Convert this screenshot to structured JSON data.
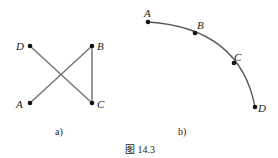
{
  "figure": {
    "caption": "图 14.3",
    "panel_a": {
      "label": "a)",
      "points": {
        "A": "A",
        "B": "B",
        "C": "C",
        "D": "D"
      },
      "edges": [
        [
          "D",
          "C"
        ],
        [
          "A",
          "B"
        ],
        [
          "B",
          "C"
        ]
      ]
    },
    "panel_b": {
      "label": "b)",
      "points": {
        "A": "A",
        "B": "B",
        "C": "C",
        "D": "D"
      },
      "curve_order": [
        "A",
        "B",
        "C",
        "D"
      ]
    }
  }
}
